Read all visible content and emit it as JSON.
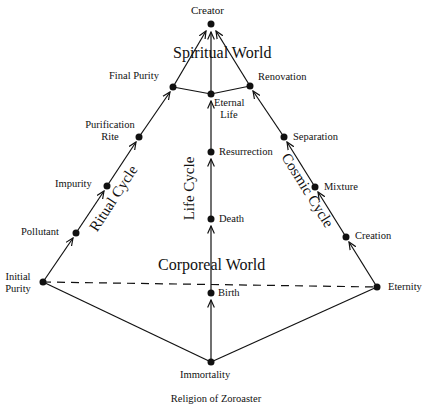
{
  "diagram": {
    "top_node": "Creator",
    "worlds": {
      "spiritual": "Spiritual World",
      "corporeal": "Corporeal World"
    },
    "cycles": {
      "ritual": "Ritual Cycle",
      "life": "Life Cycle",
      "cosmic": "Cosmic Cycle"
    },
    "nodes": {
      "creator": "Creator",
      "final_purity": "Final Purity",
      "eternal_life_1": "Eternal",
      "eternal_life_2": "Life",
      "renovation": "Renovation",
      "purification_rite_1": "Purification",
      "purification_rite_2": "Rite",
      "impurity": "Impurity",
      "pollutant": "Pollutant",
      "initial_purity_1": "Initial",
      "initial_purity_2": "Purity",
      "resurrection": "Resurrection",
      "death": "Death",
      "birth": "Birth",
      "separation": "Separation",
      "mixture": "Mixture",
      "creation": "Creation",
      "eternity": "Eternity",
      "immortality": "Immortality"
    },
    "caption": "Religion of Zoroaster"
  }
}
